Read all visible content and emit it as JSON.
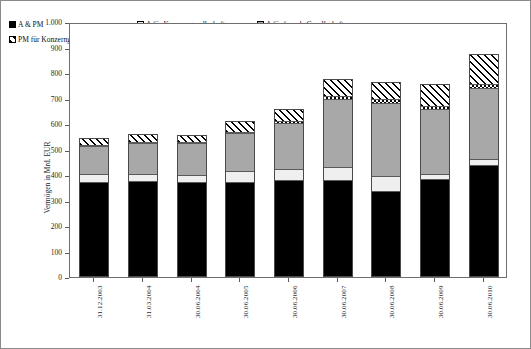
{
  "chart_data": {
    "type": "bar",
    "subtype": "stacked-vertical",
    "title": "",
    "xlabel": "",
    "ylabel": "Vermögen in Mrd. EUR",
    "ylim": [
      0,
      1000
    ],
    "ytick_step": 100,
    "ytick_labels": [
      "1.000",
      "900",
      "800",
      "700",
      "600",
      "500",
      "400",
      "300",
      "200",
      "100",
      "0"
    ],
    "grid": false,
    "legend_position": "top-inside",
    "categories": [
      "31.12.2003",
      "31.03.2004",
      "30.06.2004",
      "30.06.2005",
      "30.06.2006",
      "30.06.2007",
      "30.06.2008",
      "30.06.2009",
      "30.06.2010"
    ],
    "series": [
      {
        "name": "A & PM",
        "key": "apm",
        "fill": "solid-black",
        "color": "#000000",
        "values": [
          372,
          374,
          370,
          369,
          379,
          377,
          334,
          379,
          436
        ]
      },
      {
        "name": "A für Konzerngesellschaften",
        "key": "akonz",
        "fill": "white-dotted",
        "color": "#efefef",
        "values": [
          29,
          27,
          29,
          45,
          43,
          49,
          60,
          20,
          25
        ]
      },
      {
        "name": "A für fremde Gesellschaften",
        "key": "afremd",
        "fill": "gray-dotted",
        "color": "#a8a8a8",
        "values": [
          113,
          123,
          126,
          151,
          183,
          270,
          288,
          257,
          280
        ]
      },
      {
        "name": "PM für fremde Gesellschaften",
        "key": "pmfremd",
        "fill": "checkered",
        "color": "#ffffff",
        "values": [
          4,
          4,
          4,
          5,
          6,
          13,
          14,
          14,
          15
        ]
      },
      {
        "name": "PM für Konzerngesellschaften",
        "key": "pmkonz",
        "fill": "diagonal-hatch",
        "color": "#ffffff",
        "values": [
          27,
          31,
          28,
          42,
          48,
          68,
          68,
          87,
          120
        ]
      }
    ],
    "totals": [
      545,
      559,
      557,
      612,
      659,
      777,
      764,
      757,
      876
    ]
  },
  "legend": {
    "items": [
      {
        "label": "A & PM",
        "key": "apm"
      },
      {
        "label": "A für Konzerngesellschaften",
        "key": "akonz"
      },
      {
        "label": "A für fremde Gesellschaften",
        "key": "afremd"
      },
      {
        "label": "PM für Konzerngesellschaften",
        "key": "pmkonz"
      },
      {
        "label": "PM für fremde Gesellschaften",
        "key": "pmfremd"
      }
    ]
  }
}
